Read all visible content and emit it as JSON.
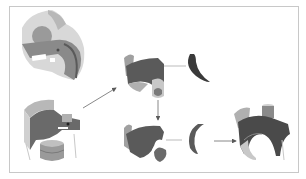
{
  "figure": {
    "type": "cad-part-decomposition-diagram",
    "frame_color": "#c8c8c8",
    "colors": {
      "dark_gray": "#5a5a5a",
      "mid_gray": "#8a8a8a",
      "light_gray": "#b8b8b8",
      "pale_gray": "#d8d8d8",
      "arrow": "#6a6a6a"
    },
    "parts": [
      {
        "id": "source-part-top",
        "description": "shaded 3D part, top-left"
      },
      {
        "id": "source-part-bottom",
        "description": "3D part with cylinder, bottom-left"
      },
      {
        "id": "decomposed-main",
        "description": "curved shell segment, center-top"
      },
      {
        "id": "decomposed-arc",
        "description": "thin crescent piece, top-right of center"
      },
      {
        "id": "decomposed-lower",
        "description": "lower shell with hole, center-bottom"
      },
      {
        "id": "decomposed-crescent",
        "description": "crescent segment, center-right bottom"
      },
      {
        "id": "result-part",
        "description": "recombined part, bottom-right"
      }
    ],
    "arrows": [
      {
        "from": "source-part-bottom",
        "to": "decomposed-main"
      },
      {
        "from": "decomposed-main",
        "to": "decomposed-lower"
      },
      {
        "from": "decomposed-crescent",
        "to": "result-part"
      }
    ]
  }
}
